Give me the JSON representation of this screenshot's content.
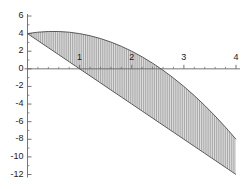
{
  "chart_data": {
    "type": "area",
    "title": "",
    "xlabel": "",
    "ylabel": "",
    "xlim": [
      -0.12,
      4.15
    ],
    "ylim": [
      -12.6,
      6.4
    ],
    "grid": false,
    "legend": null,
    "axis_color": "#555555",
    "curve_color": "#4d4d4d",
    "fill_color": "#d9d9d9",
    "hatch": "vertical-lines",
    "x_ticks": [
      1,
      2,
      3,
      4
    ],
    "x_tick_labels": [
      "1",
      "2",
      "3",
      "4"
    ],
    "x_minor_ticks": [
      0.2,
      0.4,
      0.6,
      0.8,
      1.2,
      1.4,
      1.6,
      1.8,
      2.2,
      2.4,
      2.6,
      2.8,
      3.2,
      3.4,
      3.6,
      3.8
    ],
    "y_ticks": [
      6,
      4,
      2,
      0,
      -2,
      -4,
      -6,
      -8,
      -10,
      -12
    ],
    "y_tick_labels": [
      "6",
      "4",
      "2",
      "0",
      "-2",
      "-4",
      "-6",
      "-8",
      "-10",
      "-12"
    ],
    "y_minor_ticks": [
      5,
      3,
      1,
      -1,
      -3,
      -5,
      -7,
      -9,
      -11
    ],
    "series": [
      {
        "name": "upper",
        "x": [
          0,
          0.2,
          0.4,
          0.6,
          0.8,
          1.0,
          1.2,
          1.4,
          1.6,
          1.8,
          2.0,
          2.2,
          2.4,
          2.6,
          2.8,
          3.0,
          3.2,
          3.4,
          3.6,
          3.8,
          4.0
        ],
        "y": [
          4.0,
          4.16,
          4.24,
          4.24,
          4.16,
          4.0,
          3.76,
          3.44,
          3.04,
          2.56,
          2.0,
          1.36,
          0.64,
          -0.16,
          -1.04,
          -2.0,
          -3.04,
          -4.16,
          -5.36,
          -6.64,
          -8.0
        ]
      },
      {
        "name": "lower",
        "x": [
          0,
          0.2,
          0.4,
          0.6,
          0.8,
          1.0,
          1.2,
          1.4,
          1.6,
          1.8,
          2.0,
          2.2,
          2.4,
          2.6,
          2.8,
          3.0,
          3.2,
          3.4,
          3.6,
          3.8,
          4.0
        ],
        "y": [
          4.0,
          3.2,
          2.4,
          1.6,
          0.8,
          0.0,
          -0.8,
          -1.6,
          -2.4,
          -3.2,
          -4.0,
          -4.8,
          -5.6,
          -6.4,
          -7.2,
          -8.0,
          -8.8,
          -9.6,
          -10.4,
          -11.2,
          -12.0
        ]
      }
    ],
    "intersections": [
      [
        0,
        4
      ],
      [
        4,
        -12
      ]
    ]
  }
}
